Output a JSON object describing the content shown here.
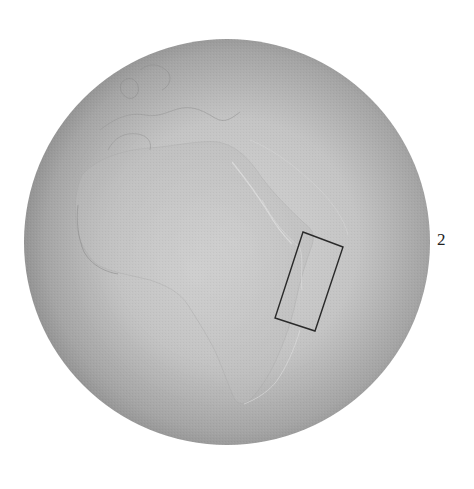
{
  "figure": {
    "globe": {
      "center": [
        227,
        242
      ],
      "radius": 203,
      "fill_center": "#cfcfcf",
      "fill_edge": "#8e8e8e"
    },
    "highlight_box": {
      "corners": [
        [
          303,
          232
        ],
        [
          343,
          247
        ],
        [
          315,
          331
        ],
        [
          275,
          318
        ]
      ],
      "stroke": "#2a2a2a",
      "region": "East Africa coast"
    },
    "label": {
      "text": "2",
      "position": [
        437,
        231
      ]
    }
  }
}
